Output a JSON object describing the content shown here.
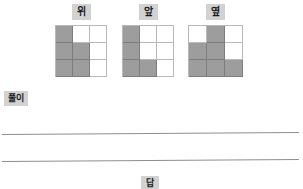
{
  "views": [
    {
      "label": "위",
      "name": "top-view",
      "grid": [
        [
          1,
          0,
          0
        ],
        [
          1,
          1,
          0
        ],
        [
          1,
          1,
          0
        ]
      ]
    },
    {
      "label": "앞",
      "name": "front-view",
      "grid": [
        [
          1,
          0,
          0
        ],
        [
          1,
          0,
          0
        ],
        [
          1,
          1,
          0
        ]
      ]
    },
    {
      "label": "옆",
      "name": "side-view",
      "grid": [
        [
          0,
          1,
          0
        ],
        [
          1,
          1,
          0
        ],
        [
          1,
          1,
          1
        ]
      ]
    }
  ],
  "solution": {
    "label": "풀이",
    "lines": [
      "",
      ""
    ]
  },
  "answer": {
    "label": "답",
    "value": ""
  },
  "colors": {
    "cell_fill": "#9d9d9d",
    "cell_border": "#b9b9b9",
    "label_bg": "#d2d2d2",
    "rule": "#8e8e8e",
    "page_bg": "#ffffff"
  }
}
